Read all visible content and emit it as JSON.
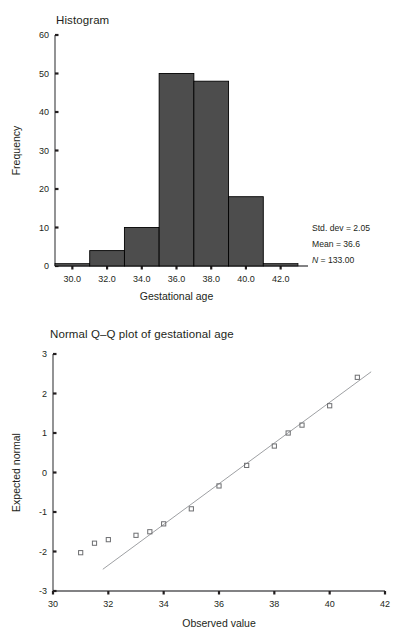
{
  "figures": {
    "histogram": {
      "title": "Histogram",
      "stats": {
        "std_dev": "Std. dev = 2.05",
        "mean": "Mean = 36.6",
        "n_italic": "N",
        "n_value": " = 133.00"
      }
    },
    "qq": {
      "title": "Normal Q–Q plot of gestational age"
    }
  },
  "chart_data": [
    {
      "type": "bar",
      "title": "Histogram",
      "xlabel": "Gestational age",
      "ylabel": "Frequency",
      "xlim": [
        29,
        43
      ],
      "ylim": [
        0,
        60
      ],
      "xticks": [
        30.0,
        32.0,
        34.0,
        36.0,
        38.0,
        40.0,
        42.0
      ],
      "xticklabels": [
        "30.0",
        "32.0",
        "34.0",
        "36.0",
        "38.0",
        "40.0",
        "42.0"
      ],
      "yticks": [
        0,
        10,
        20,
        30,
        40,
        50,
        60
      ],
      "yticklabels": [
        "0",
        "10",
        "20",
        "30",
        "40",
        "50",
        "60"
      ],
      "bin_width": 2,
      "bin_edges": [
        29,
        31,
        33,
        35,
        37,
        39,
        41,
        43
      ],
      "categories": [
        "29-31",
        "31-33",
        "33-35",
        "35-37",
        "37-39",
        "39-41",
        "41-43"
      ],
      "values": [
        0,
        4,
        10,
        50,
        48,
        18,
        0
      ],
      "bar_color": "#4d4d4d",
      "bar_edge_color": "#000000",
      "grid": false,
      "legend": false,
      "annotations": [
        "Std. dev = 2.05",
        "Mean = 36.6",
        "N = 133.00"
      ]
    },
    {
      "type": "scatter",
      "title": "Normal Q–Q plot of gestational age",
      "xlabel": "Observed value",
      "ylabel": "Expected normal",
      "xlim": [
        30,
        42
      ],
      "ylim": [
        -3,
        3
      ],
      "xticks": [
        30,
        32,
        34,
        36,
        38,
        40,
        42
      ],
      "xticklabels": [
        "30",
        "32",
        "34",
        "36",
        "38",
        "40",
        "42"
      ],
      "yticks": [
        3,
        2,
        1,
        0,
        -1,
        -2,
        -3
      ],
      "yticklabels": [
        "3",
        "2",
        "1",
        "0",
        "-1",
        "-2",
        "-3"
      ],
      "marker": "square-open",
      "point_color": "#6d6e71",
      "line_color": "#939598",
      "grid": false,
      "legend": false,
      "x": [
        31.0,
        31.5,
        32.0,
        33.0,
        33.5,
        34.0,
        35.0,
        36.0,
        37.0,
        38.0,
        38.5,
        39.0,
        40.0,
        41.0
      ],
      "y": [
        -2.03,
        -1.79,
        -1.7,
        -1.59,
        -1.5,
        -1.3,
        -0.92,
        -0.34,
        0.18,
        0.67,
        1.0,
        1.2,
        1.69,
        2.41
      ],
      "reference_line": {
        "x": [
          31.8,
          41.5
        ],
        "y": [
          -2.45,
          2.55
        ]
      }
    }
  ]
}
